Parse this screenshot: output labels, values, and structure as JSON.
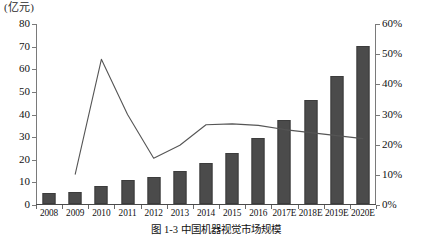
{
  "chart_data": {
    "type": "bar",
    "title": "",
    "caption": "图 1-3  中国机器视觉市场规模",
    "xlabel": "",
    "ylabel": "(亿元)",
    "y2label": "",
    "grid": false,
    "legend": "none",
    "categories": [
      "2008",
      "2009",
      "2010",
      "2011",
      "2012",
      "2013",
      "2014",
      "2015",
      "2016",
      "2017E",
      "2018E",
      "2019E",
      "2020E"
    ],
    "ylim": [
      0,
      80
    ],
    "y_ticks": [
      "0",
      "10",
      "20",
      "30",
      "40",
      "50",
      "60",
      "70",
      "80"
    ],
    "y2lim": [
      0,
      60
    ],
    "y2_ticks": [
      "0%",
      "10%",
      "20%",
      "30%",
      "40%",
      "50%",
      "60%"
    ],
    "series": [
      {
        "name": "市场规模",
        "type": "bar",
        "axis": "left",
        "unit": "亿元",
        "color": "#4b4b4b",
        "values": [
          4.8,
          5.3,
          8.0,
          10.4,
          12.0,
          14.4,
          18.2,
          22.5,
          29.0,
          37.0,
          46.0,
          56.5,
          70.0
        ]
      },
      {
        "name": "增长率",
        "type": "line",
        "axis": "right",
        "unit": "%",
        "color": "#555555",
        "values": [
          null,
          10.2,
          48.3,
          30.0,
          15.5,
          19.8,
          26.6,
          26.9,
          26.4,
          25.0,
          24.0,
          23.0,
          22.0
        ]
      }
    ]
  },
  "axis_unit_label": "(亿元)"
}
